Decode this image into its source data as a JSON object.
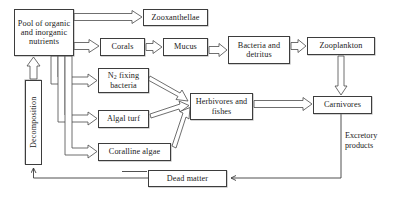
{
  "diagram": {
    "type": "flow-diagram",
    "background_color": "#ffffff",
    "line_color": "#3d3d3d",
    "nodes": [
      {
        "id": "pool",
        "label": "Pool of organic and inorganic nutrients",
        "shape": "box",
        "x": 14,
        "y": 9,
        "w": 60,
        "h": 47
      },
      {
        "id": "zooxanthellae",
        "label": "Zooxanthellae",
        "shape": "box",
        "x": 143,
        "y": 9,
        "w": 65,
        "h": 17
      },
      {
        "id": "corals",
        "label": "Corals",
        "shape": "box",
        "x": 100,
        "y": 38,
        "w": 45,
        "h": 18
      },
      {
        "id": "mucus",
        "label": "Mucus",
        "shape": "box",
        "x": 163,
        "y": 38,
        "w": 45,
        "h": 18
      },
      {
        "id": "bacteria",
        "label": "Bacteria and detritus",
        "shape": "box",
        "x": 228,
        "y": 36,
        "w": 62,
        "h": 28
      },
      {
        "id": "zooplankton",
        "label": "Zooplankton",
        "shape": "box",
        "x": 307,
        "y": 37,
        "w": 68,
        "h": 18
      },
      {
        "id": "n2fixing",
        "label": "N2 fixing bacteria",
        "shape": "box",
        "x": 98,
        "y": 68,
        "w": 51,
        "h": 25
      },
      {
        "id": "algalturf",
        "label": "Algal turf",
        "shape": "box",
        "x": 98,
        "y": 110,
        "w": 51,
        "h": 18
      },
      {
        "id": "coralline",
        "label": "Coralline algae",
        "shape": "box",
        "x": 98,
        "y": 143,
        "w": 73,
        "h": 18
      },
      {
        "id": "herbivores",
        "label": "Herbivores and fishes",
        "shape": "box",
        "x": 190,
        "y": 93,
        "w": 63,
        "h": 27
      },
      {
        "id": "carnivores",
        "label": "Carnivores",
        "shape": "box",
        "x": 313,
        "y": 96,
        "w": 59,
        "h": 18
      },
      {
        "id": "decomposition",
        "label": "Decomposition",
        "shape": "box-vertical",
        "x": 25,
        "y": 80,
        "w": 17,
        "h": 85
      },
      {
        "id": "deadmatter",
        "label": "Dead matter",
        "shape": "box",
        "x": 148,
        "y": 170,
        "w": 79,
        "h": 17
      }
    ],
    "labels": [
      {
        "id": "excretory",
        "text": "Excretory products",
        "x": 345,
        "y": 131
      }
    ],
    "edges": [
      {
        "from": "pool",
        "to": "zooxanthellae",
        "style": "hollow-arrow"
      },
      {
        "from": "pool",
        "to": "corals",
        "style": "hollow-arrow"
      },
      {
        "from": "corals",
        "to": "mucus",
        "style": "hollow-arrow"
      },
      {
        "from": "mucus",
        "to": "bacteria",
        "style": "hollow-arrow"
      },
      {
        "from": "bacteria",
        "to": "zooplankton",
        "style": "hollow-arrow"
      },
      {
        "from": "zooplankton",
        "to": "carnivores",
        "style": "hollow-arrow"
      },
      {
        "from": "pool",
        "to": "n2fixing",
        "style": "hollow-arrow"
      },
      {
        "from": "pool",
        "to": "algalturf",
        "style": "hollow-arrow"
      },
      {
        "from": "pool",
        "to": "coralline",
        "style": "hollow-arrow"
      },
      {
        "from": "n2fixing",
        "to": "herbivores",
        "style": "hollow-arrow"
      },
      {
        "from": "algalturf",
        "to": "herbivores",
        "style": "hollow-arrow"
      },
      {
        "from": "coralline",
        "to": "herbivores",
        "style": "hollow-arrow"
      },
      {
        "from": "herbivores",
        "to": "carnivores",
        "style": "hollow-arrow"
      },
      {
        "from": "decomposition",
        "to": "pool",
        "style": "hollow-arrow"
      },
      {
        "from": "deadmatter",
        "to": "decomposition",
        "style": "line-arrow"
      },
      {
        "from": "carnivores",
        "to": "deadmatter",
        "style": "line-arrow",
        "label": "Excretory products"
      },
      {
        "from": "herbivores",
        "to": "deadmatter",
        "style": "line-arrow"
      }
    ]
  }
}
